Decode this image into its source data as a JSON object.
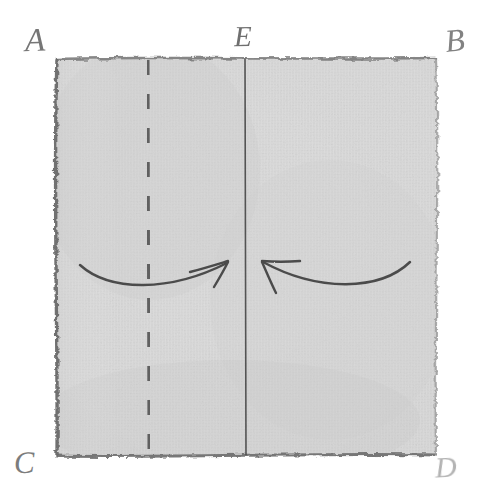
{
  "figure": {
    "title": "Hand-drawn folding diagram of a square cloth",
    "medium": "pencil sketch on white paper",
    "background_color": "#ffffff",
    "cloth": {
      "name": "square-cloth",
      "fill_color": "#d6d6d6",
      "edge_color": "#6f6f6f",
      "bounds": {
        "left": 55,
        "top": 58,
        "right": 437,
        "bottom": 456
      },
      "texture": "woven fabric weave"
    },
    "labels": [
      {
        "id": "A",
        "text": "A",
        "position": "top-left",
        "color": "#767676"
      },
      {
        "id": "E",
        "text": "E",
        "position": "top-center",
        "color": "#6f6f6f"
      },
      {
        "id": "B",
        "text": "B",
        "position": "top-right",
        "color": "#828282"
      },
      {
        "id": "C",
        "text": "C",
        "position": "bottom-left",
        "color": "#7c7c7c"
      },
      {
        "id": "D",
        "text": "D",
        "position": "bottom-right",
        "color": "#b3b3b3"
      }
    ],
    "lines": [
      {
        "id": "left-fold-line",
        "style": "dashed",
        "x": 148,
        "color": "#5e5e5e"
      },
      {
        "id": "center-fold-line",
        "style": "solid",
        "x": 245,
        "color": "#4a4a4a"
      },
      {
        "id": "right-fold-line",
        "style": "dashed",
        "x": 345,
        "color": "#5e5e5e"
      }
    ],
    "arrows": [
      {
        "id": "left-fold-arrow",
        "direction": "right",
        "description": "curved arrow sweeping from the left edge inward to the centre line",
        "color": "#4e4e4e"
      },
      {
        "id": "right-fold-arrow",
        "direction": "left",
        "description": "curved arrow sweeping from the right edge inward to the centre line",
        "color": "#4e4e4e"
      }
    ]
  }
}
